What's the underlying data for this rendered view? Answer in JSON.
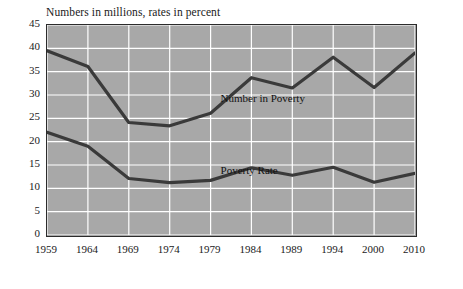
{
  "caption": "Numbers in millions, rates in percent",
  "chart_data": {
    "type": "line",
    "title": "Numbers in millions, rates in percent",
    "xlabel": "",
    "ylabel": "",
    "ylim": [
      0,
      45
    ],
    "ytick_step": 5,
    "yticks": [
      "0",
      "5",
      "10",
      "15",
      "20",
      "25",
      "30",
      "35",
      "40",
      "45"
    ],
    "grid": true,
    "grid_color": "#ffffff",
    "plot_background": "#a8a8a8",
    "line_color": "#3a3a3a",
    "categories": [
      "1959",
      "1964",
      "1969",
      "1974",
      "1979",
      "1984",
      "1989",
      "1994",
      "2000",
      "2010"
    ],
    "x": [
      1959,
      1964,
      1969,
      1974,
      1979,
      1984,
      1989,
      1994,
      2000,
      2010
    ],
    "series": [
      {
        "name": "Number in Poverty",
        "values": [
          39.5,
          36.1,
          24.1,
          23.4,
          26.1,
          33.7,
          31.5,
          38.1,
          31.6,
          39.0
        ]
      },
      {
        "name": "Poverty Rate",
        "values": [
          22.0,
          19.0,
          12.1,
          11.2,
          11.7,
          14.4,
          12.8,
          14.5,
          11.3,
          13.2
        ]
      }
    ],
    "annotations": [
      {
        "text": "Number in Poverty",
        "x": 1985,
        "y": 29.0
      },
      {
        "text": "Poverty Rate",
        "x": 1985,
        "y": 13.6
      }
    ],
    "legend_position": "inline-labels"
  }
}
